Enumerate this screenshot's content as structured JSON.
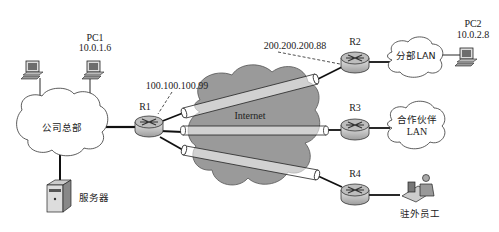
{
  "diagram": {
    "type": "network-topology",
    "nodes": {
      "pc1": {
        "name": "PC1",
        "ip": "10.0.1.6"
      },
      "pc_hq_other": {
        "name": ""
      },
      "hq": {
        "label": "公司总部"
      },
      "server": {
        "label": "服务器"
      },
      "r1": {
        "label": "R1",
        "ip": "100.100.100.99"
      },
      "internet": {
        "label": "Internet"
      },
      "r2": {
        "label": "R2",
        "ip": "200.200.200.88"
      },
      "branch": {
        "label": "分部LAN"
      },
      "pc2": {
        "name": "PC2",
        "ip": "10.0.2.8"
      },
      "r3": {
        "label": "R3"
      },
      "partner": {
        "line1": "合作伙伴",
        "line2": "LAN"
      },
      "r4": {
        "label": "R4"
      },
      "remote": {
        "label": "驻外员工"
      }
    },
    "edges": [
      [
        "pc_hq_other",
        "hq"
      ],
      [
        "pc1",
        "hq"
      ],
      [
        "hq",
        "server"
      ],
      [
        "hq",
        "r1"
      ],
      [
        "r1",
        "r2",
        "tunnel"
      ],
      [
        "r1",
        "r3",
        "tunnel"
      ],
      [
        "r1",
        "r4",
        "tunnel"
      ],
      [
        "r2",
        "branch"
      ],
      [
        "branch",
        "pc2"
      ],
      [
        "r3",
        "partner"
      ],
      [
        "r4",
        "remote"
      ]
    ],
    "colors": {
      "internet_cloud": "#9a9a9a",
      "lan_cloud": "#ffffff",
      "router_top": "#b8b8b8",
      "router_body": "#cfcfcf",
      "line": "#111111"
    }
  }
}
